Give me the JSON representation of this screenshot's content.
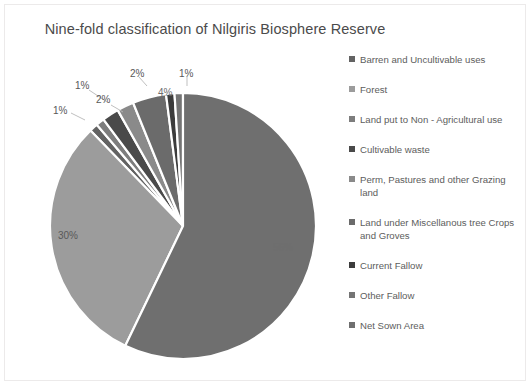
{
  "chart_title": "Nine-fold classification of Nilgiris Biosphere Reserve",
  "legend": {
    "position": "right",
    "items": [
      {
        "label": "Barren and Uncultivable uses",
        "color": "#636363"
      },
      {
        "label": "Forest",
        "color": "#9c9c9c"
      },
      {
        "label": "Land put to Non - Agricultural use",
        "color": "#7d7d7d"
      },
      {
        "label": "Cultivable waste",
        "color": "#4a4a4a"
      },
      {
        "label": "Perm, Pastures and other Grazing land",
        "color": "#8a8a8a"
      },
      {
        "label": "Land under Miscellanous tree Crops and Groves",
        "color": "#6b6b6b"
      },
      {
        "label": "Current Fallow",
        "color": "#3c3c3c"
      },
      {
        "label": "Other Fallow",
        "color": "#747474"
      },
      {
        "label": "Net Sown Area",
        "color": "#6f6f6f"
      }
    ]
  },
  "labels": {
    "l0": "1%",
    "l1": "30%",
    "l2": "1%",
    "l3": "2%",
    "l4": "2%",
    "l5": "4%",
    "l6": "1%",
    "l7": "56%"
  },
  "chart_data": {
    "type": "pie",
    "title": "Nine-fold classification of Nilgiris Biosphere Reserve",
    "xlabel": "",
    "ylabel": "",
    "legend_position": "right",
    "units": "percent",
    "categories": [
      "Barren and Uncultivable uses",
      "Forest",
      "Land put to Non - Agricultural use",
      "Cultivable waste",
      "Perm, Pastures and other Grazing land",
      "Land under Miscellanous tree Crops and Groves",
      "Current Fallow",
      "Other Fallow",
      "Net Sown Area"
    ],
    "values": [
      1,
      30,
      1,
      2,
      2,
      4,
      1,
      1,
      56
    ],
    "data_labels": [
      "1%",
      "30%",
      "1%",
      "2%",
      "2%",
      "4%",
      "1%",
      "1%",
      "56%"
    ],
    "colors": [
      "#636363",
      "#9c9c9c",
      "#7d7d7d",
      "#4a4a4a",
      "#8a8a8a",
      "#6b6b6b",
      "#3c3c3c",
      "#747474",
      "#6f6f6f"
    ],
    "grid": false
  }
}
